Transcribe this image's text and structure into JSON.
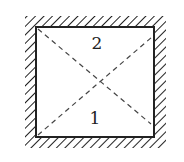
{
  "diagram": {
    "type": "enclosure-with-diagonals",
    "labels": {
      "top": "2",
      "bottom": "1"
    },
    "colors": {
      "stroke": "#222222",
      "background": "#ffffff"
    }
  }
}
